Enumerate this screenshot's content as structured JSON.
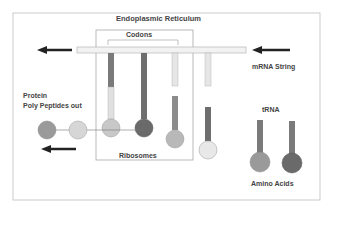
{
  "diagram": {
    "labels": {
      "er": "Endoplasmic Reticulum",
      "codons": "Codons",
      "mrna": "mRNA String",
      "protein_line1": "Protein",
      "protein_line2": "Poly Peptides out",
      "trna": "tRNA",
      "ribosomes": "Ribosomes",
      "amino_acids": "Amino Acids"
    },
    "colors": {
      "border": "#b0b0b0",
      "mrna_bar": "#f2f2f2",
      "dark_stem": "#6e6e6e",
      "mid_stem": "#8c8c8c",
      "light_stem": "#d8d8d8",
      "ball_dark": "#6a6a6a",
      "ball_mid": "#9a9a9a",
      "ball_light": "#cfcfcf",
      "arrow": "#222222"
    }
  }
}
